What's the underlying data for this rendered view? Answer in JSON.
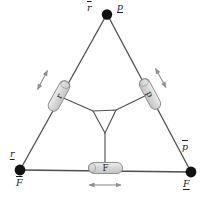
{
  "colors": {
    "background": "#ffffff",
    "line": "#4e4e4e",
    "dot": "#121212",
    "box_fill": "#d8d8d8",
    "box_fill_light": "#ebebeb",
    "box_border": "#8f8f8f",
    "arrow": "#8f8f8f",
    "label": "#1c1c1c"
  },
  "vertices": {
    "top": {
      "left": {
        "text": "r",
        "deco": "overline"
      },
      "right": {
        "text": "p",
        "deco": "underline"
      }
    },
    "bottom_left": {
      "top": {
        "text": "r",
        "deco": "underline"
      },
      "bottom": {
        "text": "F",
        "deco": "overline"
      }
    },
    "bottom_right": {
      "top": {
        "text": "p",
        "deco": "overline"
      },
      "bottom": {
        "text": "F",
        "deco": "underline"
      }
    }
  },
  "actuators": {
    "left": {
      "label": "r"
    },
    "right": {
      "label": "p"
    },
    "bottom": {
      "label": "F"
    }
  }
}
